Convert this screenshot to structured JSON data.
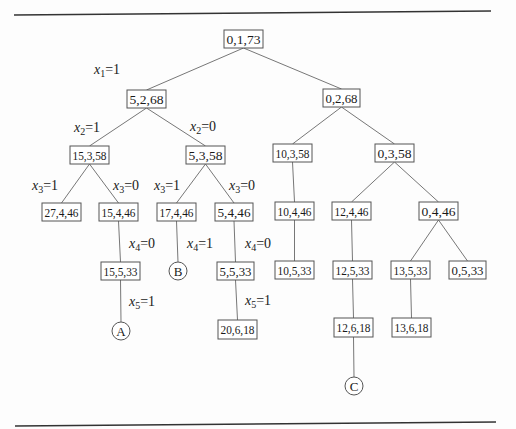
{
  "figure": {
    "type": "state-space tree (branch and bound)",
    "node_style": {
      "box_stroke": "#555555",
      "line_color": "#777777",
      "rule_color": "#333333",
      "text_color": "#1a1a1a"
    },
    "nodes": [
      {
        "id": "n0",
        "label": "0,1,73",
        "shape": "box",
        "x": 224,
        "y": 30,
        "w": 39,
        "h": 18
      },
      {
        "id": "n1",
        "label": "5,2,68",
        "shape": "box",
        "x": 127,
        "y": 90,
        "w": 39,
        "h": 18
      },
      {
        "id": "n2",
        "label": "0,2,68",
        "shape": "box",
        "x": 323,
        "y": 89,
        "w": 37,
        "h": 18
      },
      {
        "id": "n3",
        "label": "15,3,58",
        "shape": "box",
        "x": 70,
        "y": 146,
        "w": 39,
        "h": 18
      },
      {
        "id": "n4",
        "label": "5,3,58",
        "shape": "box",
        "x": 186,
        "y": 146,
        "w": 39,
        "h": 18
      },
      {
        "id": "n5",
        "label": "10,3,58",
        "shape": "box",
        "x": 273,
        "y": 144,
        "w": 39,
        "h": 18
      },
      {
        "id": "n6",
        "label": "0,3,58",
        "shape": "box",
        "x": 375,
        "y": 144,
        "w": 39,
        "h": 18
      },
      {
        "id": "n7",
        "label": "27,4,46",
        "shape": "box",
        "x": 42,
        "y": 203,
        "w": 39,
        "h": 18
      },
      {
        "id": "n8",
        "label": "15,4,46",
        "shape": "box",
        "x": 99,
        "y": 203,
        "w": 39,
        "h": 18
      },
      {
        "id": "n9",
        "label": "17,4,46",
        "shape": "box",
        "x": 157,
        "y": 203,
        "w": 39,
        "h": 18
      },
      {
        "id": "n10",
        "label": "5,4,46",
        "shape": "box",
        "x": 215,
        "y": 203,
        "w": 38,
        "h": 18
      },
      {
        "id": "n11",
        "label": "10,4,46",
        "shape": "box",
        "x": 275,
        "y": 202,
        "w": 39,
        "h": 18
      },
      {
        "id": "n12",
        "label": "12,4,46",
        "shape": "box",
        "x": 332,
        "y": 202,
        "w": 39,
        "h": 18
      },
      {
        "id": "n13",
        "label": "0,4,46",
        "shape": "box",
        "x": 419,
        "y": 202,
        "w": 39,
        "h": 18
      },
      {
        "id": "n14",
        "label": "15,5,33",
        "shape": "box",
        "x": 101,
        "y": 262,
        "w": 39,
        "h": 18
      },
      {
        "id": "n15",
        "label": "B",
        "shape": "circle",
        "cx": 178,
        "cy": 271,
        "r": 9
      },
      {
        "id": "n16",
        "label": "5,5,33",
        "shape": "box",
        "x": 217,
        "y": 262,
        "w": 37,
        "h": 18
      },
      {
        "id": "n17",
        "label": "10,5,33",
        "shape": "box",
        "x": 275,
        "y": 261,
        "w": 39,
        "h": 18
      },
      {
        "id": "n18",
        "label": "12,5,33",
        "shape": "box",
        "x": 333,
        "y": 261,
        "w": 39,
        "h": 18
      },
      {
        "id": "n19",
        "label": "13,5,33",
        "shape": "box",
        "x": 391,
        "y": 261,
        "w": 39,
        "h": 18
      },
      {
        "id": "n20",
        "label": "0,5,33",
        "shape": "box",
        "x": 449,
        "y": 261,
        "w": 37,
        "h": 18
      },
      {
        "id": "n21",
        "label": "A",
        "shape": "circle",
        "cx": 121,
        "cy": 331,
        "r": 9
      },
      {
        "id": "n22",
        "label": "20,6,18",
        "shape": "box",
        "x": 218,
        "y": 320,
        "w": 39,
        "h": 19
      },
      {
        "id": "n23",
        "label": "12,6,18",
        "shape": "box",
        "x": 334,
        "y": 318,
        "w": 39,
        "h": 19
      },
      {
        "id": "n24",
        "label": "13,6,18",
        "shape": "box",
        "x": 392,
        "y": 318,
        "w": 39,
        "h": 19
      },
      {
        "id": "n25",
        "label": "C",
        "shape": "circle",
        "cx": 354,
        "cy": 386,
        "r": 9
      }
    ],
    "edges": [
      {
        "from": "n0",
        "to": "n1",
        "label_var": "x",
        "label_sub": "1",
        "label_val": "=1",
        "lx": 94,
        "ly": 74
      },
      {
        "from": "n0",
        "to": "n2"
      },
      {
        "from": "n1",
        "to": "n3",
        "label_var": "x",
        "label_sub": "2",
        "label_val": "=1",
        "lx": 74,
        "ly": 132
      },
      {
        "from": "n1",
        "to": "n4",
        "label_var": "x",
        "label_sub": "2",
        "label_val": "=0",
        "lx": 190,
        "ly": 131
      },
      {
        "from": "n2",
        "to": "n5"
      },
      {
        "from": "n2",
        "to": "n6"
      },
      {
        "from": "n3",
        "to": "n7",
        "label_var": "x",
        "label_sub": "3",
        "label_val": "=1",
        "lx": 32,
        "ly": 190
      },
      {
        "from": "n3",
        "to": "n8",
        "label_var": "x",
        "label_sub": "3",
        "label_val": "=0",
        "lx": 113,
        "ly": 190
      },
      {
        "from": "n4",
        "to": "n9",
        "label_var": "x",
        "label_sub": "3",
        "label_val": "=1",
        "lx": 154,
        "ly": 190
      },
      {
        "from": "n4",
        "to": "n10",
        "label_var": "x",
        "label_sub": "3",
        "label_val": "=0",
        "lx": 229,
        "ly": 190
      },
      {
        "from": "n5",
        "to": "n11"
      },
      {
        "from": "n6",
        "to": "n12"
      },
      {
        "from": "n6",
        "to": "n13"
      },
      {
        "from": "n8",
        "to": "n14",
        "label_var": "x",
        "label_sub": "4",
        "label_val": "=0",
        "lx": 129,
        "ly": 248
      },
      {
        "from": "n9",
        "to": "n15",
        "label_var": "x",
        "label_sub": "4",
        "label_val": "=1",
        "lx": 187,
        "ly": 248
      },
      {
        "from": "n10",
        "to": "n16",
        "label_var": "x",
        "label_sub": "4",
        "label_val": "=0",
        "lx": 245,
        "ly": 248
      },
      {
        "from": "n11",
        "to": "n17"
      },
      {
        "from": "n12",
        "to": "n18"
      },
      {
        "from": "n13",
        "to": "n19"
      },
      {
        "from": "n13",
        "to": "n20"
      },
      {
        "from": "n14",
        "to": "n21",
        "label_var": "x",
        "label_sub": "5",
        "label_val": "=1",
        "lx": 129,
        "ly": 306
      },
      {
        "from": "n16",
        "to": "n22",
        "label_var": "x",
        "label_sub": "5",
        "label_val": "=1",
        "lx": 245,
        "ly": 305
      },
      {
        "from": "n18",
        "to": "n23"
      },
      {
        "from": "n19",
        "to": "n24"
      },
      {
        "from": "n23",
        "to": "n25"
      }
    ],
    "rules": [
      {
        "x1": 14,
        "y1": 15,
        "x2": 491,
        "y2": 11
      },
      {
        "x1": 15,
        "y1": 426,
        "x2": 496,
        "y2": 422
      }
    ]
  }
}
